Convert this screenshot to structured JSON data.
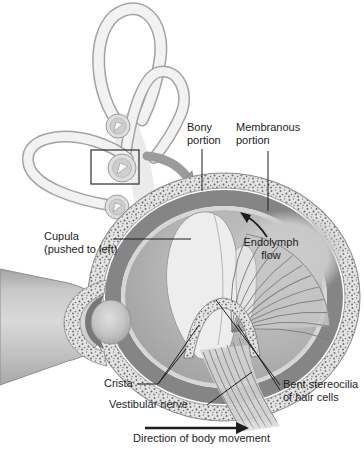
{
  "figure_type": "anatomical-diagram",
  "labels": {
    "bony_portion": "Bony\nportion",
    "membranous_portion": "Membranous\nportion",
    "cupula": "Cupula\n(pushed to left)",
    "endolymph_flow": "Endolymph\nflow",
    "crista": "Crista",
    "vestibular_nerve": "Vestibular nerve",
    "bent_stereocilia": "Bent stereocilia\nof hair cells",
    "direction_of_body_movement": "Direction of body movement"
  },
  "icons": {
    "zoom_arrow": "curved-arrow-pointing-to-enlarged-view",
    "endolymph_flow_arrow": "curved-arrow-counterclockwise",
    "direction_arrow": "arrow-right",
    "cupula_arrows_in_overview": "small-white-arrows-inside-ampullae"
  },
  "colors": {
    "background": "#ffffff",
    "text": "#1d1d1d",
    "leader_line": "#1d1d1d",
    "bony_ring": "#e3e3e3",
    "stipple_dot": "#6e6e6e",
    "perilymph_ring": "#858585",
    "membrane_ring": "#d6d6d6",
    "interior": "#b4b4b4",
    "cupula_fill": "#ededed",
    "zoom_arrow_gray": "#9b9b9b"
  }
}
